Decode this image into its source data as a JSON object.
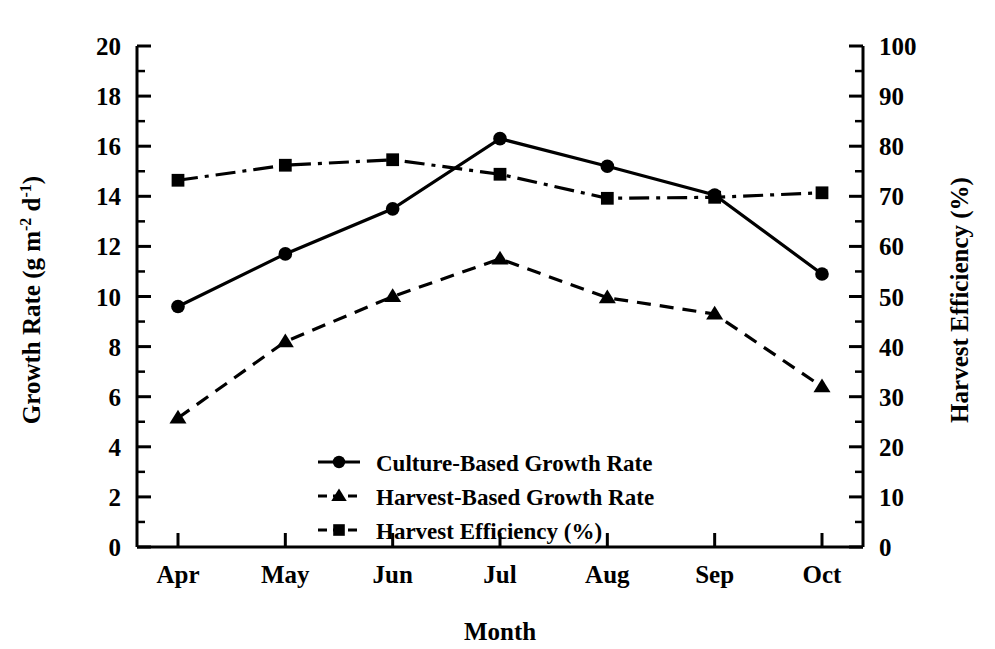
{
  "chart_data": {
    "type": "line",
    "title": "",
    "xlabel": "Month",
    "ylabel_left": "Growth Rate (g m-2 d-1)",
    "ylabel_left_parts": {
      "main": "Growth Rate (g m",
      "sup1": "-2",
      "mid": " d",
      "sup2": "-1",
      "tail": ")"
    },
    "ylabel_right": "Harvest Efficiency (%)",
    "categories": [
      "Apr",
      "May",
      "Jun",
      "Jul",
      "Aug",
      "Sep",
      "Oct"
    ],
    "ylim_left": [
      0,
      20
    ],
    "ylim_right": [
      0,
      100
    ],
    "yticks_left": [
      "0",
      "2",
      "4",
      "6",
      "8",
      "10",
      "12",
      "14",
      "16",
      "18",
      "20"
    ],
    "yticks_right": [
      "0",
      "10",
      "20",
      "30",
      "40",
      "50",
      "60",
      "70",
      "80",
      "90",
      "100"
    ],
    "minor_ticks_left": [
      1,
      3,
      5,
      7,
      9,
      11,
      13,
      15,
      17,
      19
    ],
    "minor_ticks_right": [
      5,
      15,
      25,
      35,
      45,
      55,
      65,
      75,
      85,
      95
    ],
    "grid": false,
    "legend_position": "inside-center-bottom",
    "series": [
      {
        "name": "Culture-Based Growth Rate",
        "axis": "left",
        "marker": "circle",
        "linestyle": "solid",
        "color": "#000000",
        "values": [
          9.6,
          11.7,
          13.5,
          16.3,
          15.2,
          14.05,
          10.9
        ]
      },
      {
        "name": "Harvest-Based Growth Rate",
        "axis": "left",
        "marker": "triangle",
        "linestyle": "dashed",
        "color": "#000000",
        "values": [
          5.15,
          8.2,
          10.0,
          11.5,
          9.95,
          9.3,
          6.4
        ]
      },
      {
        "name": "Harvest Efficiency (%)",
        "axis": "right",
        "marker": "square",
        "linestyle": "dashdot",
        "color": "#000000",
        "values": [
          73.2,
          76.2,
          77.3,
          74.4,
          69.6,
          69.8,
          70.7
        ]
      }
    ]
  }
}
